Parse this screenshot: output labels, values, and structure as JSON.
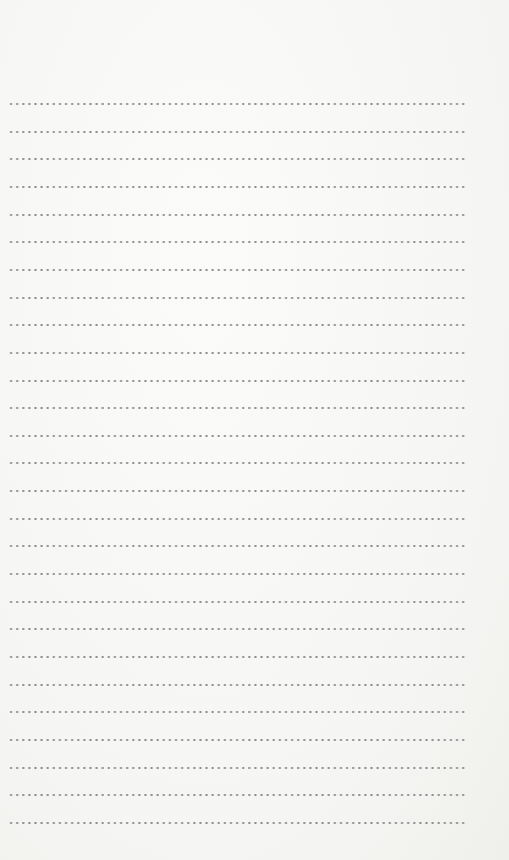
{
  "page": {
    "type": "blank dotted writing sheet",
    "background_color": "#f7f7f5",
    "dot_color": "#8c8c8c",
    "line_count": 27,
    "first_line_y": 103,
    "line_spacing": 27.65,
    "line_left": 8,
    "line_width": 460
  }
}
